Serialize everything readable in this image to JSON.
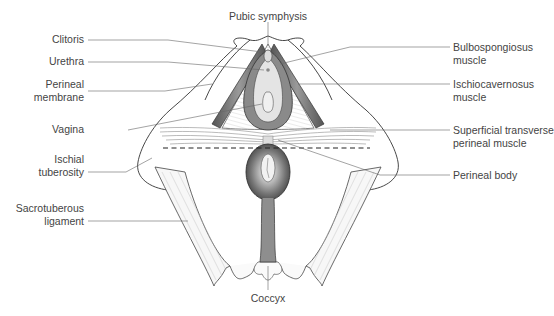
{
  "diagram": {
    "labels": {
      "pubic_symphysis": "Pubic symphysis",
      "clitoris": "Clitoris",
      "urethra": "Urethra",
      "perineal_membrane_1": "Perineal",
      "perineal_membrane_2": "membrane",
      "vagina": "Vagina",
      "ischial_tuberosity_1": "Ischial",
      "ischial_tuberosity_2": "tuberosity",
      "sacrotuberous_ligament_1": "Sacrotuberous",
      "sacrotuberous_ligament_2": "ligament",
      "coccyx": "Coccyx",
      "bulbospongiosus_1": "Bulbospongiosus",
      "bulbospongiosus_2": "muscle",
      "ischiocavernosus_1": "Ischiocavernosus",
      "ischiocavernosus_2": "muscle",
      "superficial_transverse_1": "Superficial transverse",
      "superficial_transverse_2": "perineal muscle",
      "perineal_body": "Perineal body"
    },
    "colors": {
      "outline": "#333333",
      "leader": "#666666",
      "muscle_dark": "#6e6e6e",
      "muscle_light": "#c8c8c8",
      "background": "#ffffff"
    }
  }
}
